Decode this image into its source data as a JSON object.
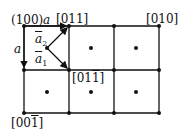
{
  "labels": {
    "origin": "(100)",
    "top_mid": "[011]",
    "top_right": "[010]",
    "bottom_left_prefix": "[00",
    "bottom_left_bar": "1",
    "bottom_left_suffix": "]",
    "mid_prefix": "[01",
    "mid_bar": "1",
    "mid_suffix": "]",
    "a_horizontal": "a",
    "a_vertical": "a",
    "vec_a2": "a",
    "vec_a2_sub": "2",
    "vec_a1": "a",
    "vec_a1_sub": "1"
  },
  "grid": {
    "x": [
      24,
      69,
      114,
      159
    ],
    "y": [
      26,
      70,
      113
    ],
    "centers": [
      [
        47,
        48
      ],
      [
        91,
        48
      ],
      [
        136,
        48
      ],
      [
        47,
        92
      ],
      [
        91,
        92
      ],
      [
        136,
        92
      ]
    ],
    "color": "#111111"
  }
}
